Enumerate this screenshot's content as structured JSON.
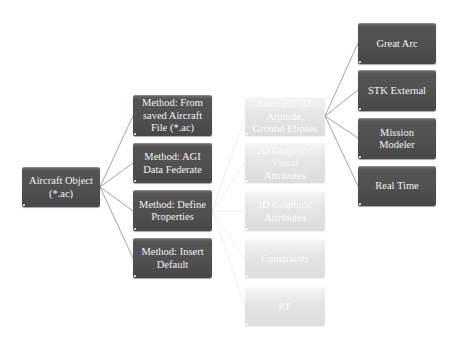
{
  "diagram": {
    "title": "",
    "colors": {
      "dark_node": "#505050",
      "light_node": "#e3e3e3",
      "dark_text": "#f2f2f2",
      "light_text": "#fbfbfb",
      "connector_dark": "#8c8c8c",
      "connector_light": "#ededed"
    },
    "root": {
      "label": "Aircraft Object\n(*.ac)"
    },
    "methods": [
      {
        "label": "Method: From\nsaved Aircraft\nFile (*.ac)"
      },
      {
        "label": "Method: AGI\nData Federate"
      },
      {
        "label": "Method: Define\nProperties"
      },
      {
        "label": "Method: Insert\nDefault"
      }
    ],
    "properties": [
      {
        "label": "Basic 2D/3D:\nAttitude,\nGround Elipses"
      },
      {
        "label": "2D Graphics:\nVisual\nAttributes"
      },
      {
        "label": "3D Graphics:\nAttributes"
      },
      {
        "label": "Constraints"
      },
      {
        "label": "RF"
      }
    ],
    "propagators": [
      {
        "label": "Great Arc"
      },
      {
        "label": "STK External"
      },
      {
        "label": "Mission\nModeler"
      },
      {
        "label": "Real Time"
      }
    ]
  }
}
